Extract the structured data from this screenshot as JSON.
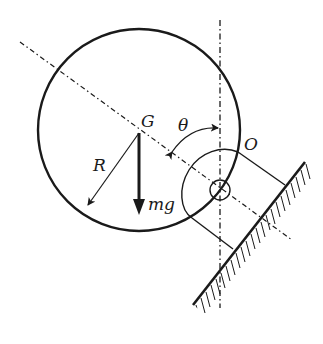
{
  "diagram": {
    "labels": {
      "center": "G",
      "angle": "θ",
      "pivot": "O",
      "radius": "R",
      "weight": "mg"
    },
    "colors": {
      "stroke": "#1a1a1a",
      "background": "#ffffff"
    },
    "elements": [
      "disk (circle, center G, radius R)",
      "vertical dash-dot reference line through O",
      "dash-dot line through G and O",
      "angle arc θ between vertical and line GO",
      "radius arrow R",
      "weight arrow mg downward from G",
      "pivot circle O",
      "bracket attached to inclined hatched wall"
    ]
  }
}
